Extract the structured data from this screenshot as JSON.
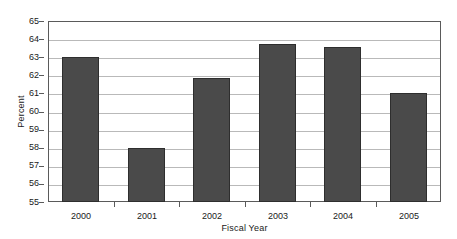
{
  "chart_data": {
    "type": "bar",
    "title": "",
    "subtitle": "",
    "xlabel": "Fiscal Year",
    "ylabel": "Percent",
    "categories": [
      "2000",
      "2001",
      "2002",
      "2003",
      "2004",
      "2005"
    ],
    "values": [
      63.0,
      58.0,
      61.85,
      63.72,
      63.58,
      61.02
    ],
    "series": [
      {
        "name": "Percent",
        "values": [
          63.0,
          58.0,
          61.85,
          63.72,
          63.58,
          61.02
        ]
      }
    ],
    "ylim": [
      55,
      65
    ],
    "y_ticks": [
      55,
      56,
      57,
      58,
      59,
      60,
      61,
      62,
      63,
      64,
      65
    ],
    "y_tick_labels": [
      "55",
      "56",
      "57",
      "58",
      "59",
      "60",
      "61",
      "62",
      "63",
      "64",
      "65"
    ],
    "grid": true,
    "grid_axis": "y",
    "legend": false,
    "legend_position": "none",
    "annotations": [],
    "bar_color": "#4a4a4a",
    "bar_edge_color": "#2e2e2e",
    "gridline_color": "#b9b9b9",
    "frame_color": "#5a5a5a",
    "background_color": "#ffffff",
    "text_color": "#1a1a1a"
  }
}
